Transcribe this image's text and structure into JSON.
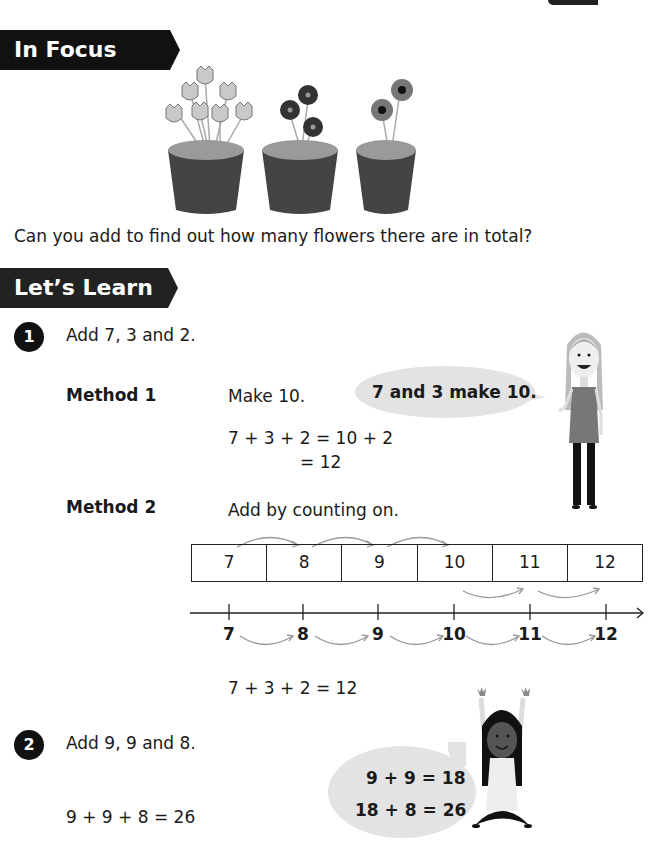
{
  "in_focus": {
    "banner": "In Focus",
    "question": "Can you add to find out how many flowers there are in total?",
    "pots": [
      {
        "flower_type": "tulip",
        "count": 7
      },
      {
        "flower_type": "dark-flower",
        "count": 3
      },
      {
        "flower_type": "daisy",
        "count": 2
      }
    ]
  },
  "lets_learn": {
    "banner": "Let’s Learn",
    "q1": {
      "number": "1",
      "prompt": "Add 7, 3 and 2.",
      "method1": {
        "label": "Method 1",
        "instruction": "Make 10.",
        "line1": "7 + 3 + 2 = 10 + 2",
        "line2": "= 12",
        "speech": "7 and 3 make 10."
      },
      "method2": {
        "label": "Method 2",
        "instruction": "Add by counting on.",
        "strip_cells": [
          "7",
          "8",
          "9",
          "10",
          "11",
          "12"
        ],
        "number_line": [
          "7",
          "8",
          "9",
          "10",
          "11",
          "12"
        ],
        "result": "7 + 3 + 2 = 12"
      }
    },
    "q2": {
      "number": "2",
      "prompt": "Add 9, 9 and 8.",
      "result": "9 + 9 + 8 = 26",
      "speech_line1": "9 + 9 = 18",
      "speech_line2": "18 + 8 = 26"
    }
  }
}
